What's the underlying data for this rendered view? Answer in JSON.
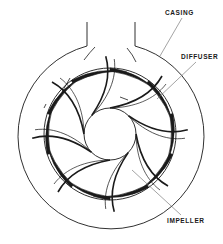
{
  "diagram": {
    "type": "cross-section",
    "labels": {
      "casing": "CASING",
      "diffuser": "DIFFUSER",
      "impeller": "IMPELLER"
    },
    "colors": {
      "line": "#1a1a1a",
      "leader": "#666666",
      "background": "#ffffff"
    },
    "components": [
      {
        "name": "casing",
        "shape": "circle with top outlet throat"
      },
      {
        "name": "diffuser",
        "shape": "ring of curved tapered vanes"
      },
      {
        "name": "impeller",
        "shape": "curved spiral vanes around central eye"
      }
    ]
  }
}
